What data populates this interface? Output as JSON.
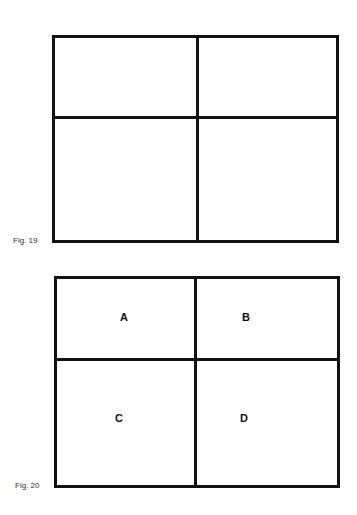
{
  "figures": [
    {
      "caption": "Fig. 19",
      "cells": []
    },
    {
      "caption": "Fig. 20",
      "cells": [
        "A",
        "B",
        "C",
        "D"
      ]
    }
  ]
}
